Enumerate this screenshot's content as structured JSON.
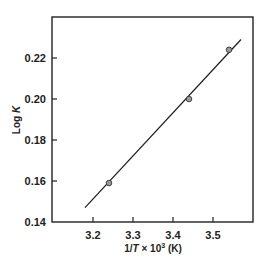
{
  "chart_data": {
    "type": "scatter",
    "title": "",
    "xlabel": "1/T × 10³ (K)",
    "xlabel_parts": {
      "pre": "1/",
      "var": "T",
      "mid": " × 10",
      "sup": "3",
      "post": " (K)"
    },
    "ylabel": "Log K",
    "ylabel_parts": {
      "pre": "Log ",
      "var": "K"
    },
    "xlim": [
      3.1,
      3.6
    ],
    "ylim": [
      0.14,
      0.24
    ],
    "xticks": [
      3.2,
      3.3,
      3.4,
      3.5
    ],
    "xtick_labels": [
      "3.2",
      "3.3",
      "3.4",
      "3.5"
    ],
    "yticks": [
      0.14,
      0.16,
      0.18,
      0.2,
      0.22
    ],
    "ytick_labels": [
      "0.14",
      "0.16",
      "0.18",
      "0.20",
      "0.22"
    ],
    "grid": false,
    "legend": null,
    "series": [
      {
        "name": "data",
        "marker": "circle",
        "marker_fill": "#9a9a9a",
        "points": [
          {
            "x": 3.24,
            "y": 0.159
          },
          {
            "x": 3.44,
            "y": 0.2
          },
          {
            "x": 3.54,
            "y": 0.224
          }
        ]
      },
      {
        "name": "fit",
        "type": "line",
        "color": "#222222",
        "points": [
          {
            "x": 3.18,
            "y": 0.147
          },
          {
            "x": 3.57,
            "y": 0.229
          }
        ]
      }
    ]
  }
}
